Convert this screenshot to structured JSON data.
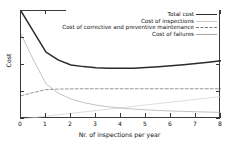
{
  "chart_data": {
    "type": "line",
    "title": "",
    "xlabel": "Nr. of inspections per year",
    "ylabel": "Cost",
    "xlim": [
      0,
      8
    ],
    "ylim": [
      0,
      1
    ],
    "grid": false,
    "legend_position": "top-right",
    "xticks": [
      "0",
      "1",
      "2",
      "3",
      "4",
      "5",
      "6",
      "7",
      "8"
    ],
    "yticks": [],
    "x": [
      0,
      0.5,
      1,
      1.5,
      2,
      2.5,
      3,
      3.5,
      4,
      4.5,
      5,
      5.5,
      6,
      6.5,
      7,
      7.5,
      8
    ],
    "series": [
      {
        "name": "Total cost",
        "style": "solid",
        "color": "#2b2b2b",
        "width": 1.5,
        "values": [
          1.0,
          0.81,
          0.62,
          0.545,
          0.5,
          0.485,
          0.475,
          0.471,
          0.469,
          0.471,
          0.476,
          0.483,
          0.492,
          0.502,
          0.513,
          0.526,
          0.54
        ]
      },
      {
        "name": "Cost of inspections",
        "style": "solid",
        "color": "#cfcfcf",
        "width": 0.7,
        "values": [
          0.0,
          0.013,
          0.026,
          0.039,
          0.052,
          0.065,
          0.078,
          0.091,
          0.104,
          0.117,
          0.13,
          0.143,
          0.156,
          0.169,
          0.182,
          0.195,
          0.208
        ]
      },
      {
        "name": "Cost of corrective and preventive maintenance",
        "style": "dashed",
        "color": "#7d7d7d",
        "width": 0.8,
        "values": [
          0.215,
          0.245,
          0.272,
          0.277,
          0.279,
          0.28,
          0.28,
          0.28,
          0.28,
          0.28,
          0.28,
          0.28,
          0.28,
          0.28,
          0.28,
          0.28,
          0.28
        ]
      },
      {
        "name": "Cost of failures",
        "style": "solid",
        "color": "#a8a8a8",
        "width": 0.7,
        "values": [
          0.785,
          0.545,
          0.325,
          0.238,
          0.185,
          0.152,
          0.129,
          0.113,
          0.101,
          0.092,
          0.085,
          0.079,
          0.074,
          0.07,
          0.067,
          0.064,
          0.061
        ]
      }
    ]
  },
  "axes": {
    "xlabel": "Nr. of inspections per year",
    "ylabel": "Cost",
    "xticks": [
      "0",
      "1",
      "2",
      "3",
      "4",
      "5",
      "6",
      "7",
      "8"
    ]
  },
  "legend": {
    "items": [
      {
        "label": "Total cost",
        "style": "total"
      },
      {
        "label": "Cost of inspections",
        "style": "insp"
      },
      {
        "label": "Cost of corrective and preventive maintenance",
        "style": "maint"
      },
      {
        "label": "Cost of failures",
        "style": "fail"
      }
    ]
  }
}
